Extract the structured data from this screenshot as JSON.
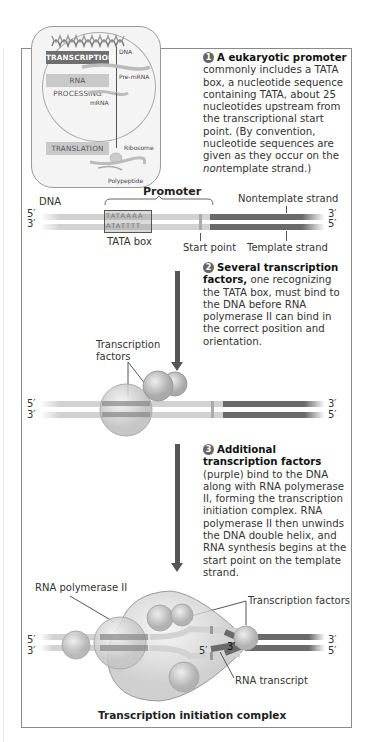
{
  "overview": {
    "stages": [
      "TRANSCRIPTION",
      "RNA PROCESSING",
      "TRANSLATION"
    ],
    "labels": {
      "dna": "DNA",
      "pre_mrna": "Pre-mRNA",
      "mrna": "mRNA",
      "ribosome": "Ribosome",
      "polypeptide": "Polypeptide"
    }
  },
  "steps": [
    {
      "number": "1",
      "heading": "A eukaryotic promoter",
      "body_1": "commonly includes a TATA box, a nucleotide sequence containing TATA, about 25 nucleotides upstream from the transcriptional start point. (By convention, nucleotide sequences are given as they occur on the ",
      "body_em": "non",
      "body_2": "template strand.)"
    },
    {
      "number": "2",
      "heading": "Several transcription factors,",
      "body": " one recognizing the TATA box, must bind to the DNA before RNA polymerase II can bind in the correct position and orientation."
    },
    {
      "number": "3",
      "heading": "Additional transcription factors",
      "body": " (purple) bind to the DNA along with RNA polymerase II, forming the transcription initiation complex. RNA polymerase II then unwinds the DNA double helix, and RNA synthesis begins at the start point on the template strand."
    }
  ],
  "panel1": {
    "promoter": "Promoter",
    "dna": "DNA",
    "nontemplate": "Nontemplate strand",
    "template": "Template strand",
    "start_point": "Start point",
    "tata_box": "TATA box",
    "seq_top": "TATAAAA",
    "seq_bottom": "ATATTTT",
    "five_prime": "5′",
    "three_prime": "3′"
  },
  "panel2": {
    "transcription_factors": "Transcription factors"
  },
  "panel3": {
    "rna_polymerase": "RNA polymerase II",
    "transcription_factors": "Transcription factors",
    "rna_transcript": "RNA transcript",
    "five_prime": "5′",
    "three_prime": "3′",
    "caption": "Transcription initiation complex"
  },
  "colors": {
    "light_strand": "#d2d2d2",
    "dark_strand": "#6a6a6a",
    "factor": "#d9d9d9",
    "frame": "#8a8a8a"
  }
}
